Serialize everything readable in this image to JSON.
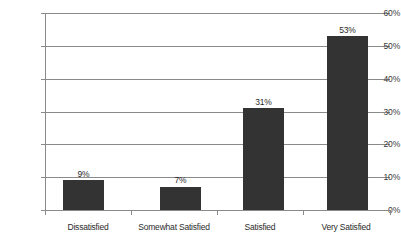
{
  "chart_data": {
    "type": "bar",
    "title": "",
    "subtitle": "",
    "xlabel": "",
    "ylabel": "",
    "categories": [
      "Dissatisfied",
      "Somewhat Satisfied",
      "Satisfied",
      "Very Satisfied"
    ],
    "values": [
      9,
      7,
      31,
      53
    ],
    "data_labels": [
      "9%",
      "7%",
      "31%",
      "53%"
    ],
    "ylim": [
      0,
      60
    ],
    "y_tick_values": [
      0,
      10,
      20,
      30,
      40,
      50,
      60
    ],
    "y_tick_labels": [
      "0%",
      "10%",
      "20%",
      "30%",
      "40%",
      "50%",
      "60%"
    ],
    "grid": true,
    "grid_axis": "y",
    "legend": false,
    "legend_position": "none",
    "colors": {
      "bar": "#333333",
      "gridline": "#8a8a8a",
      "axis": "#8a8a8a",
      "text": "#2b2b2b",
      "background": "#ffffff"
    }
  }
}
